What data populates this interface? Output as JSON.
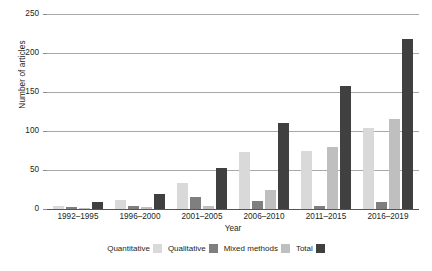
{
  "chart_data": {
    "type": "bar",
    "title": "",
    "xlabel": "Year",
    "ylabel": "Number of articles",
    "ylim": [
      0,
      250
    ],
    "ytick_labels": [
      "250",
      "200",
      "150",
      "100",
      "50",
      "0"
    ],
    "ytick_values": [
      250,
      200,
      150,
      100,
      50,
      0
    ],
    "grid": true,
    "legend_position": "bottom",
    "categories": [
      "1992–1995",
      "1996–2000",
      "2001–2005",
      "2006–2010",
      "2011–2015",
      "2016–2019"
    ],
    "series": [
      {
        "name": "Quantitative",
        "color": "#d9d9d9",
        "values": [
          4,
          11,
          33,
          73,
          75,
          104
        ]
      },
      {
        "name": "Qualitative",
        "color": "#7f7f7f",
        "values": [
          3,
          4,
          15,
          10,
          4,
          9
        ]
      },
      {
        "name": "Mixed methods",
        "color": "#bfbfbf",
        "values": [
          1,
          2,
          4,
          25,
          79,
          116
        ]
      },
      {
        "name": "Total",
        "color": "#404040",
        "values": [
          9,
          19,
          52,
          110,
          158,
          218
        ]
      }
    ]
  },
  "legend": {
    "items": [
      {
        "label": "Quantitative",
        "color": "#d9d9d9"
      },
      {
        "label": "Qualitative",
        "color": "#7f7f7f"
      },
      {
        "label": "Mixed methods",
        "color": "#bfbfbf"
      },
      {
        "label": "Total",
        "color": "#404040"
      }
    ]
  }
}
